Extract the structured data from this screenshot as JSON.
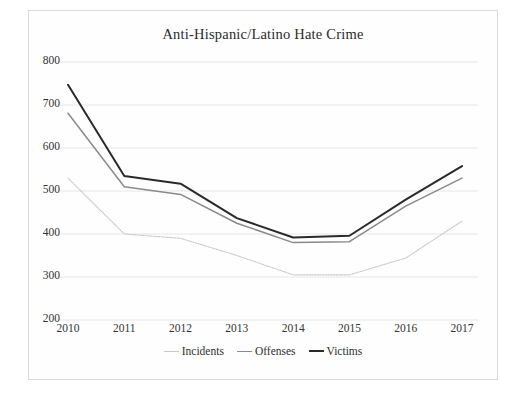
{
  "figure": {
    "title": "Anti-Hispanic/Latino Hate Crime"
  },
  "axes": {
    "y_ticks": [
      "800",
      "700",
      "600",
      "500",
      "400",
      "300",
      "200"
    ],
    "x_ticks": [
      "2010",
      "2011",
      "2012",
      "2013",
      "2014",
      "2015",
      "2016",
      "2017"
    ]
  },
  "legend": {
    "items": [
      {
        "label": "Incidents",
        "color": "#c8c8c8"
      },
      {
        "label": "Offenses",
        "color": "#8a8a8a"
      },
      {
        "label": "Victims",
        "color": "#2a2a2a"
      }
    ]
  },
  "chart_data": {
    "type": "line",
    "title": "Anti-Hispanic/Latino Hate Crime",
    "xlabel": "",
    "ylabel": "",
    "categories": [
      "2010",
      "2011",
      "2012",
      "2013",
      "2014",
      "2015",
      "2016",
      "2017"
    ],
    "x": [
      2010,
      2011,
      2012,
      2013,
      2014,
      2015,
      2016,
      2017
    ],
    "ylim": [
      200,
      800
    ],
    "yticks": [
      200,
      300,
      400,
      500,
      600,
      700,
      800
    ],
    "grid": true,
    "legend_position": "bottom",
    "series": [
      {
        "name": "Incidents",
        "color": "#c8c8c8",
        "values": [
          530,
          400,
          390,
          350,
          305,
          305,
          344,
          430
        ]
      },
      {
        "name": "Offenses",
        "color": "#8a8a8a",
        "values": [
          681,
          510,
          492,
          425,
          380,
          382,
          465,
          530
        ]
      },
      {
        "name": "Victims",
        "color": "#2a2a2a",
        "values": [
          747,
          535,
          517,
          437,
          392,
          396,
          480,
          558
        ]
      }
    ]
  }
}
